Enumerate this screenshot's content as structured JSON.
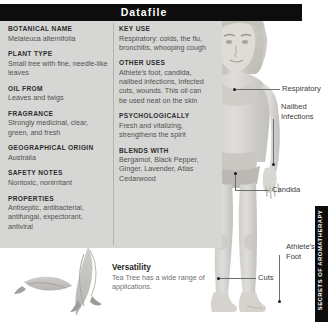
{
  "header": {
    "title": "Datafile"
  },
  "side_tab": {
    "label": "SECRETS OF AROMATHERAPY"
  },
  "left_column": [
    {
      "label": "BOTANICAL NAME",
      "value": "Melaleuca alternifolia"
    },
    {
      "label": "PLANT TYPE",
      "value": "Small tree with fine, needle-like leaves"
    },
    {
      "label": "OIL FROM",
      "value": "Leaves and twigs"
    },
    {
      "label": "FRAGRANCE",
      "value": "Strongly medicinal, clear, green, and fresh"
    },
    {
      "label": "GEOGRAPHICAL ORIGIN",
      "value": "Australia"
    },
    {
      "label": "SAFETY NOTES",
      "value": "Nontoxic, nonirritant"
    },
    {
      "label": "PROPERTIES",
      "value": "Antiseptic, antibacterial, antifungal, expectorant, antiviral"
    }
  ],
  "right_column": [
    {
      "label": "KEY USE",
      "value": "Respiratory: colds, the flu, bronchitis, whooping cough"
    },
    {
      "label": "OTHER USES",
      "value": "Athlete's foot, candida, nailbed infections, infected cuts, wounds. This oil can be used neat on the skin"
    },
    {
      "label": "PSYCHOLOGICALLY",
      "value": "Fresh and vitalizing, strengthens the spirit"
    },
    {
      "label": "BLENDS WITH",
      "value": "Bergamot, Black Pepper, Ginger, Lavender, Atlas Cedarwood"
    }
  ],
  "versatility": {
    "title": "Versatility",
    "text": "Tea Tree has a wide range of applications."
  },
  "annotations": [
    {
      "label": "Respiratory"
    },
    {
      "label": "Nailbed\nInfections"
    },
    {
      "label": "Candida"
    },
    {
      "label": "Athlete's\nFoot"
    },
    {
      "label": "Cuts"
    }
  ],
  "colors": {
    "header_bar": "#0d0d0d",
    "panel": "#d6d6d4",
    "text": "#4a4a4a",
    "accent_dot": "#1b1b1b"
  }
}
